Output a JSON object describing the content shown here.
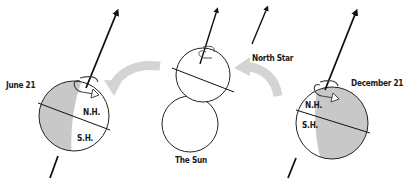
{
  "diagram": {
    "labels": {
      "june": "June 21",
      "december": "December 21",
      "north_star": "North Star",
      "sun": "The Sun",
      "june_nh": "N.H.",
      "june_sh": "S.H.",
      "december_nh": "N.H.",
      "december_sh": "S.H."
    },
    "colors": {
      "shade": "#c8c8c8",
      "orbit_arrow": "#d4d4d4",
      "line": "#111111",
      "background": "#ffffff"
    },
    "elements": [
      {
        "name": "earth-june",
        "shaded_side": "left"
      },
      {
        "name": "earth-middle",
        "shaded_side": "left-sliver"
      },
      {
        "name": "sun"
      },
      {
        "name": "earth-december",
        "shaded_side": "right"
      },
      {
        "name": "north-star-arrow"
      },
      {
        "name": "orbit-arrow-left",
        "direction": "left"
      },
      {
        "name": "orbit-arrow-right",
        "direction": "left"
      }
    ]
  }
}
